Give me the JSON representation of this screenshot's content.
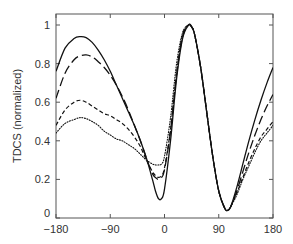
{
  "chart_data": {
    "type": "line",
    "title": "",
    "xlabel": "",
    "ylabel": "TDCS (normalized)",
    "xlim": [
      -180,
      180
    ],
    "ylim": [
      0,
      1.05
    ],
    "xticks": [
      -180,
      -90,
      0,
      90,
      180
    ],
    "xtick_labels": [
      "−180",
      "−90",
      "0",
      "90",
      "180"
    ],
    "yticks": [
      0,
      0.2,
      0.4,
      0.6,
      0.8,
      1
    ],
    "ytick_labels": [
      "0",
      "0.2",
      "0.4",
      "0.6",
      "0.8",
      "1"
    ],
    "grid": false,
    "legend": null,
    "series": [
      {
        "name": "solid",
        "style": "solid",
        "x": [
          -180,
          -165,
          -150,
          -140,
          -130,
          -120,
          -110,
          -100,
          -90,
          -80,
          -70,
          -60,
          -50,
          -40,
          -30,
          -20,
          -15,
          -10,
          -5,
          0,
          10,
          20,
          30,
          40,
          45,
          50,
          60,
          70,
          80,
          90,
          100,
          105,
          110,
          120,
          130,
          140,
          150,
          160,
          170,
          180
        ],
        "y": [
          0.76,
          0.88,
          0.93,
          0.94,
          0.935,
          0.91,
          0.87,
          0.82,
          0.76,
          0.69,
          0.62,
          0.55,
          0.48,
          0.4,
          0.31,
          0.2,
          0.14,
          0.1,
          0.1,
          0.15,
          0.4,
          0.72,
          0.93,
          1.0,
          0.99,
          0.95,
          0.78,
          0.55,
          0.32,
          0.14,
          0.05,
          0.04,
          0.06,
          0.16,
          0.28,
          0.4,
          0.51,
          0.61,
          0.7,
          0.78
        ]
      },
      {
        "name": "long-dash",
        "style": "long-dash",
        "x": [
          -180,
          -165,
          -150,
          -140,
          -130,
          -120,
          -110,
          -100,
          -90,
          -80,
          -70,
          -60,
          -50,
          -40,
          -30,
          -20,
          -15,
          -10,
          -5,
          0,
          10,
          20,
          30,
          40,
          45,
          50,
          60,
          70,
          80,
          90,
          100,
          105,
          110,
          120,
          130,
          140,
          150,
          160,
          170,
          180
        ],
        "y": [
          0.62,
          0.75,
          0.82,
          0.84,
          0.845,
          0.835,
          0.81,
          0.78,
          0.74,
          0.69,
          0.63,
          0.56,
          0.48,
          0.4,
          0.31,
          0.23,
          0.21,
          0.2,
          0.21,
          0.25,
          0.45,
          0.74,
          0.94,
          1.0,
          0.99,
          0.95,
          0.78,
          0.55,
          0.32,
          0.14,
          0.05,
          0.04,
          0.06,
          0.14,
          0.24,
          0.34,
          0.43,
          0.51,
          0.58,
          0.64
        ]
      },
      {
        "name": "short-dash",
        "style": "short-dash",
        "x": [
          -180,
          -165,
          -150,
          -140,
          -130,
          -120,
          -110,
          -100,
          -90,
          -80,
          -70,
          -60,
          -50,
          -40,
          -30,
          -20,
          -15,
          -10,
          -5,
          0,
          10,
          20,
          30,
          40,
          45,
          50,
          60,
          70,
          80,
          90,
          100,
          105,
          110,
          120,
          130,
          140,
          150,
          160,
          170,
          180
        ],
        "y": [
          0.48,
          0.56,
          0.6,
          0.61,
          0.6,
          0.58,
          0.56,
          0.54,
          0.53,
          0.51,
          0.49,
          0.46,
          0.42,
          0.37,
          0.3,
          0.24,
          0.22,
          0.21,
          0.22,
          0.26,
          0.46,
          0.75,
          0.95,
          1.0,
          0.99,
          0.95,
          0.78,
          0.55,
          0.32,
          0.14,
          0.05,
          0.04,
          0.06,
          0.13,
          0.21,
          0.29,
          0.36,
          0.42,
          0.46,
          0.5
        ]
      },
      {
        "name": "dotted",
        "style": "dotted",
        "x": [
          -180,
          -165,
          -150,
          -140,
          -130,
          -120,
          -110,
          -100,
          -90,
          -80,
          -70,
          -60,
          -50,
          -40,
          -30,
          -20,
          -15,
          -10,
          -5,
          0,
          10,
          20,
          30,
          40,
          45,
          50,
          60,
          70,
          80,
          90,
          100,
          105,
          110,
          120,
          130,
          140,
          150,
          160,
          170,
          180
        ],
        "y": [
          0.44,
          0.49,
          0.51,
          0.52,
          0.515,
          0.5,
          0.48,
          0.45,
          0.43,
          0.41,
          0.4,
          0.38,
          0.36,
          0.33,
          0.3,
          0.28,
          0.275,
          0.275,
          0.28,
          0.32,
          0.52,
          0.8,
          0.96,
          1.0,
          0.99,
          0.95,
          0.78,
          0.55,
          0.32,
          0.14,
          0.05,
          0.04,
          0.06,
          0.12,
          0.2,
          0.27,
          0.34,
          0.4,
          0.44,
          0.48
        ]
      }
    ]
  }
}
